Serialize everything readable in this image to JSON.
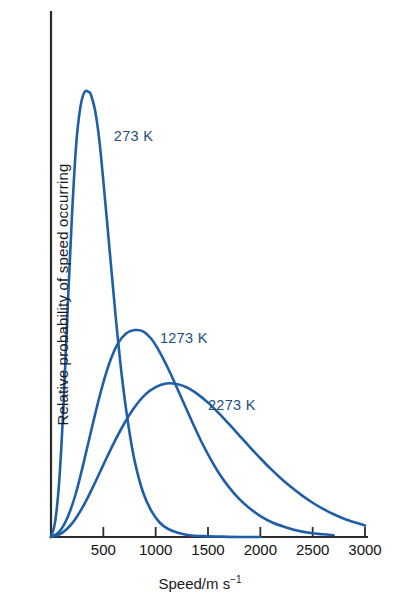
{
  "chart_data": {
    "type": "line",
    "title": "",
    "subtitle": "",
    "xlabel": "Speed/m s",
    "xlabel_exponent": "−1",
    "xlabel_full": "Speed/m s⁻¹",
    "ylabel": "Relative probability of speed occurring",
    "xlim": [
      0,
      3000
    ],
    "ylim": [
      0,
      1
    ],
    "grid": false,
    "legend_position": "inline-annotation",
    "x_ticks": [
      500,
      1000,
      1500,
      2000,
      2500,
      3000
    ],
    "x_tick_labels": [
      "500",
      "1000",
      "1500",
      "2000",
      "2500",
      "3000"
    ],
    "y_ticks": [],
    "y_tick_labels": [],
    "axis_color": "#2b2b2b",
    "curve_color": "#1f5ea8",
    "annotations": [
      {
        "text": "273 K",
        "x": 600,
        "y": 0.9
      },
      {
        "text": "1273 K",
        "x": 1040,
        "y": 0.445
      },
      {
        "text": "2273 K",
        "x": 1500,
        "y": 0.295
      }
    ],
    "series": [
      {
        "name": "273 K",
        "label": "273 K",
        "color": "#1f5ea8",
        "peak_x": 380,
        "peak_y": 1.0,
        "points": [
          [
            0,
            0.0
          ],
          [
            40,
            0.035
          ],
          [
            80,
            0.13
          ],
          [
            120,
            0.3
          ],
          [
            160,
            0.52
          ],
          [
            200,
            0.72
          ],
          [
            240,
            0.88
          ],
          [
            280,
            0.965
          ],
          [
            320,
            1.0
          ],
          [
            360,
            1.0
          ],
          [
            380,
            0.995
          ],
          [
            420,
            0.96
          ],
          [
            460,
            0.895
          ],
          [
            500,
            0.8
          ],
          [
            560,
            0.645
          ],
          [
            620,
            0.49
          ],
          [
            680,
            0.355
          ],
          [
            740,
            0.25
          ],
          [
            800,
            0.17
          ],
          [
            880,
            0.1
          ],
          [
            960,
            0.058
          ],
          [
            1040,
            0.032
          ],
          [
            1120,
            0.018
          ],
          [
            1220,
            0.009
          ],
          [
            1320,
            0.004
          ],
          [
            1450,
            0.002
          ],
          [
            1600,
            0.001
          ],
          [
            1800,
            0.0
          ],
          [
            2000,
            0.0
          ]
        ]
      },
      {
        "name": "1273 K",
        "label": "1273 K",
        "color": "#1f5ea8",
        "peak_x": 840,
        "peak_y": 0.465,
        "points": [
          [
            0,
            0.0
          ],
          [
            80,
            0.012
          ],
          [
            160,
            0.045
          ],
          [
            240,
            0.1
          ],
          [
            320,
            0.175
          ],
          [
            400,
            0.255
          ],
          [
            480,
            0.33
          ],
          [
            560,
            0.392
          ],
          [
            640,
            0.435
          ],
          [
            720,
            0.458
          ],
          [
            800,
            0.465
          ],
          [
            880,
            0.462
          ],
          [
            960,
            0.445
          ],
          [
            1040,
            0.415
          ],
          [
            1120,
            0.378
          ],
          [
            1200,
            0.337
          ],
          [
            1280,
            0.295
          ],
          [
            1360,
            0.253
          ],
          [
            1440,
            0.213
          ],
          [
            1520,
            0.177
          ],
          [
            1600,
            0.145
          ],
          [
            1700,
            0.112
          ],
          [
            1800,
            0.085
          ],
          [
            1900,
            0.064
          ],
          [
            2000,
            0.047
          ],
          [
            2120,
            0.032
          ],
          [
            2240,
            0.022
          ],
          [
            2360,
            0.014
          ],
          [
            2480,
            0.009
          ],
          [
            2600,
            0.006
          ],
          [
            2700,
            0.004
          ]
        ]
      },
      {
        "name": "2273 K",
        "label": "2273 K",
        "color": "#1f5ea8",
        "peak_x": 1150,
        "peak_y": 0.345,
        "points": [
          [
            0,
            0.0
          ],
          [
            100,
            0.008
          ],
          [
            200,
            0.03
          ],
          [
            300,
            0.066
          ],
          [
            400,
            0.112
          ],
          [
            500,
            0.162
          ],
          [
            600,
            0.211
          ],
          [
            700,
            0.255
          ],
          [
            800,
            0.292
          ],
          [
            900,
            0.32
          ],
          [
            1000,
            0.337
          ],
          [
            1100,
            0.345
          ],
          [
            1200,
            0.344
          ],
          [
            1300,
            0.336
          ],
          [
            1400,
            0.321
          ],
          [
            1500,
            0.302
          ],
          [
            1600,
            0.279
          ],
          [
            1700,
            0.254
          ],
          [
            1800,
            0.228
          ],
          [
            1900,
            0.202
          ],
          [
            2000,
            0.177
          ],
          [
            2100,
            0.153
          ],
          [
            2200,
            0.131
          ],
          [
            2300,
            0.111
          ],
          [
            2400,
            0.093
          ],
          [
            2500,
            0.077
          ],
          [
            2600,
            0.063
          ],
          [
            2700,
            0.051
          ],
          [
            2800,
            0.041
          ],
          [
            2900,
            0.033
          ],
          [
            3000,
            0.026
          ]
        ]
      }
    ]
  }
}
